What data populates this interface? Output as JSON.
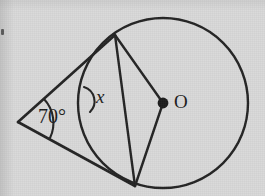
{
  "figure": {
    "kind": "geometry-diagram",
    "topic": "circle-with-two-tangents-from-external-point",
    "background_color": "#d9d9d9",
    "ink_color": "#242424",
    "labels": {
      "apex_angle": "70°",
      "unknown_angle": "x",
      "center": "O"
    },
    "circle": {
      "center_x": 163,
      "center_y": 103,
      "radius": 85
    },
    "points": {
      "apex": {
        "x": 18,
        "y": 122
      },
      "tangent_upper": {
        "x": 115,
        "y": 35
      },
      "tangent_lower": {
        "x": 135,
        "y": 186
      },
      "chord_arc_crossing": {
        "x": 86,
        "y": 100
      },
      "center_dot": {
        "x": 163,
        "y": 103,
        "r": 5
      }
    },
    "segments": [
      {
        "name": "tangent-upper-line",
        "from": "apex",
        "to": "tangent_upper"
      },
      {
        "name": "tangent-lower-line",
        "from": "apex",
        "to": "tangent_lower"
      },
      {
        "name": "chord-between-tangent-points",
        "from": "tangent_upper",
        "to": "tangent_lower"
      },
      {
        "name": "radius-to-upper-tangent",
        "from": "center",
        "to": "tangent_upper"
      },
      {
        "name": "radius-to-lower-tangent",
        "from": "center",
        "to": "tangent_lower"
      }
    ],
    "arcs": [
      {
        "name": "apex-angle-arc",
        "measure": "70°"
      },
      {
        "name": "unknown-angle-arc",
        "measure": "x"
      }
    ]
  }
}
